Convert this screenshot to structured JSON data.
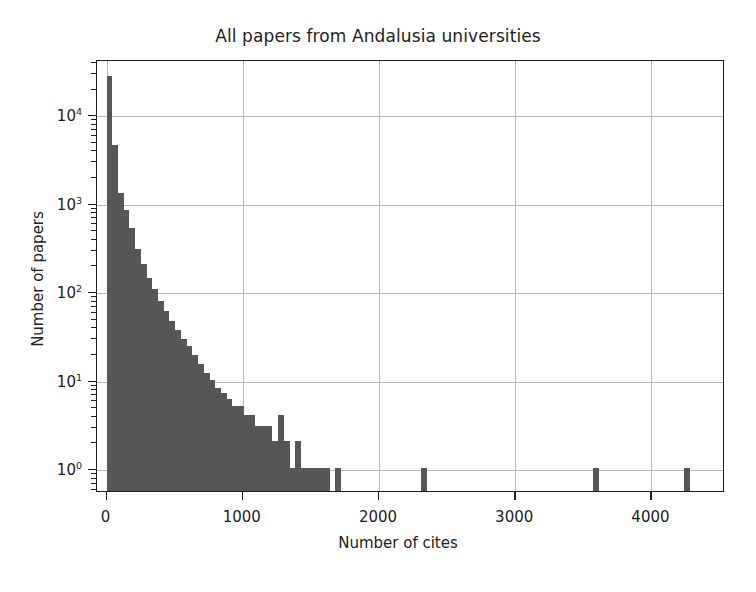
{
  "chart_data": {
    "type": "bar",
    "title": "All papers from Andalusia universities",
    "xlabel": "Number of cites",
    "ylabel": "Number of papers",
    "yscale": "log",
    "xscale": "linear",
    "xlim": [
      -70,
      4540
    ],
    "ylim": [
      0.55,
      42000
    ],
    "grid": true,
    "legend": null,
    "bin_width": 42,
    "bar_color": "#565656",
    "xticks": [
      0,
      1000,
      2000,
      3000,
      4000
    ],
    "xticklabels": [
      "0",
      "1000",
      "2000",
      "3000",
      "4000"
    ],
    "yticks": [
      1,
      10,
      100,
      1000,
      10000
    ],
    "yticklabels": [
      "10⁰",
      "10¹",
      "10²",
      "10³",
      "10⁴"
    ],
    "x": [
      0,
      42,
      84,
      126,
      168,
      210,
      252,
      294,
      336,
      378,
      420,
      462,
      504,
      546,
      588,
      630,
      672,
      714,
      756,
      798,
      840,
      882,
      924,
      966,
      1008,
      1050,
      1092,
      1134,
      1176,
      1218,
      1260,
      1302,
      1344,
      1386,
      1428,
      1470,
      1512,
      1554,
      1596,
      1638,
      1680,
      1722,
      1764,
      1806,
      1848,
      1890,
      1932,
      1974,
      2016,
      2058,
      2100,
      2142,
      2184,
      2226,
      2268,
      2310,
      2352,
      2394,
      2436,
      2478,
      2520,
      2562,
      2604,
      2646,
      2688,
      2730,
      2772,
      2814,
      2856,
      2898,
      2940,
      2982,
      3024,
      3066,
      3108,
      3150,
      3192,
      3234,
      3276,
      3318,
      3360,
      3402,
      3444,
      3486,
      3528,
      3570,
      3612,
      3654,
      3696,
      3738,
      3780,
      3822,
      3864,
      3906,
      3948,
      3990,
      4032,
      4074,
      4116,
      4158,
      4200,
      4242
    ],
    "values": [
      27000,
      4500,
      1300,
      820,
      520,
      300,
      200,
      140,
      105,
      78,
      60,
      46,
      36,
      29,
      24,
      19,
      15,
      12,
      10,
      8,
      7,
      6,
      5,
      5,
      4,
      4,
      3,
      3,
      3,
      2,
      4,
      2,
      1,
      2,
      1,
      1,
      1,
      1,
      1,
      0,
      1,
      0,
      0,
      0,
      0,
      0,
      0,
      0,
      0,
      0,
      0,
      0,
      0,
      0,
      0,
      1,
      0,
      0,
      0,
      0,
      0,
      0,
      0,
      0,
      0,
      0,
      0,
      0,
      0,
      0,
      0,
      0,
      0,
      0,
      0,
      0,
      0,
      0,
      0,
      0,
      0,
      0,
      0,
      0,
      0,
      1,
      0,
      0,
      0,
      0,
      0,
      0,
      0,
      0,
      0,
      0,
      0,
      0,
      0,
      0,
      0,
      1
    ],
    "outlier_bars": [
      {
        "x": 2310,
        "value": 1
      },
      {
        "x": 2898,
        "value": 1
      },
      {
        "x": 4242,
        "value": 1
      }
    ]
  }
}
